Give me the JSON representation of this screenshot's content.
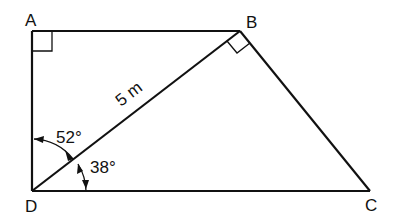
{
  "figure": {
    "type": "geometry-diagram",
    "vertices": [
      {
        "name": "A",
        "x": 32,
        "y": 31
      },
      {
        "name": "B",
        "x": 240,
        "y": 31
      },
      {
        "name": "C",
        "x": 370,
        "y": 191
      },
      {
        "name": "D",
        "x": 32,
        "y": 191
      }
    ],
    "labels": {
      "A": "A",
      "B": "B",
      "C": "C",
      "D": "D",
      "diagonal_length": "5 m",
      "angle_upper": "52°",
      "angle_lower": "38°"
    },
    "right_angles": [
      "A",
      "B (angle DBC)"
    ],
    "segments": [
      "AB",
      "BC",
      "CD",
      "DA",
      "DB"
    ]
  }
}
